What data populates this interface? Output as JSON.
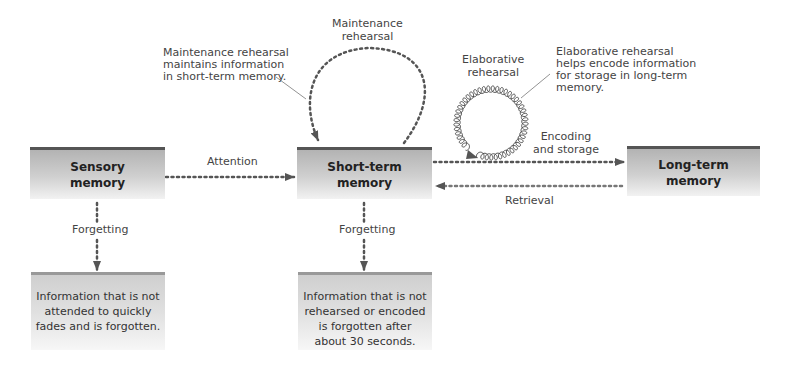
{
  "boxes": {
    "sensory": "Sensory\nmemory",
    "short_term": "Short-term\nmemory",
    "long_term": "Long-term\nmemory"
  },
  "arrows": {
    "attention": "Attention",
    "encoding": "Encoding\nand storage",
    "retrieval": "Retrieval",
    "forgetting_sensory": "Forgetting",
    "forgetting_short_term": "Forgetting"
  },
  "loops": {
    "maintenance_label": "Maintenance\nrehearsal",
    "elaborative_label": "Elaborative\nrehearsal"
  },
  "callouts": {
    "maintenance": "Maintenance rehearsal\nmaintains information\nin short-term memory.",
    "elaborative": "Elaborative rehearsal\nhelps encode information\nfor storage in long-term\nmemory."
  },
  "notes": {
    "sensory": "Information that is not\nattended to quickly\nfades and is forgotten.",
    "short_term": "Information that is not\nrehearsed or encoded\nis forgotten after\nabout 30 seconds."
  },
  "colors": {
    "arrow": "#555555",
    "box_border": "#555555"
  }
}
